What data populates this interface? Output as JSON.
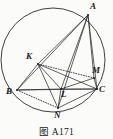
{
  "figure": {
    "caption_prefix": "图",
    "caption_number": "A171",
    "caption_full": "图 A171",
    "stroke_color": "#2b2b2e",
    "background_color": "#fbfbfa",
    "canvas": {
      "width": 113,
      "height": 139
    }
  },
  "circle": {
    "name": "circumcircle",
    "cx": 53,
    "cy": 60,
    "r": 52
  },
  "points": [
    {
      "id": "A",
      "label": "A",
      "x": 88,
      "y": 15,
      "label_x": 90,
      "label_y": 2
    },
    {
      "id": "K",
      "label": "K",
      "x": 38,
      "y": 64,
      "label_x": 26,
      "label_y": 52
    },
    {
      "id": "B",
      "label": "B",
      "x": 17,
      "y": 90,
      "label_x": 6,
      "label_y": 87
    },
    {
      "id": "M",
      "label": "M",
      "x": 94,
      "y": 78,
      "label_x": 92,
      "label_y": 66
    },
    {
      "id": "C",
      "label": "C",
      "x": 97,
      "y": 89,
      "label_x": 99,
      "label_y": 85
    },
    {
      "id": "L",
      "label": "L",
      "x": 61,
      "y": 89,
      "label_x": 61,
      "label_y": 90
    },
    {
      "id": "N",
      "label": "N",
      "x": 58,
      "y": 108,
      "label_x": 54,
      "label_y": 111
    }
  ],
  "solid_segments": [
    {
      "name": "segment-AB",
      "from": "A",
      "to": "B"
    },
    {
      "name": "segment-AK",
      "from": "A",
      "to": "K"
    },
    {
      "name": "segment-AL",
      "from": "A",
      "to": "L"
    },
    {
      "name": "segment-AN",
      "from": "A",
      "to": "N"
    },
    {
      "name": "segment-AC",
      "from": "A",
      "to": "C"
    },
    {
      "name": "segment-AM",
      "from": "A",
      "to": "M"
    },
    {
      "name": "segment-KB",
      "from": "K",
      "to": "B"
    },
    {
      "name": "segment-KL",
      "from": "K",
      "to": "L"
    },
    {
      "name": "segment-KN",
      "from": "K",
      "to": "N"
    },
    {
      "name": "segment-KC",
      "from": "K",
      "to": "C"
    },
    {
      "name": "segment-BC",
      "from": "B",
      "to": "C"
    },
    {
      "name": "segment-BL",
      "from": "B",
      "to": "L"
    },
    {
      "name": "segment-LC",
      "from": "L",
      "to": "C"
    },
    {
      "name": "segment-LN",
      "from": "L",
      "to": "N"
    },
    {
      "name": "segment-LM",
      "from": "L",
      "to": "M"
    },
    {
      "name": "segment-CN",
      "from": "C",
      "to": "N"
    },
    {
      "name": "segment-MC",
      "from": "M",
      "to": "C"
    }
  ],
  "dotted_segments": [
    {
      "name": "segment-KM",
      "from": "K",
      "to": "M"
    },
    {
      "name": "segment-BN",
      "from": "B",
      "to": "N"
    }
  ]
}
